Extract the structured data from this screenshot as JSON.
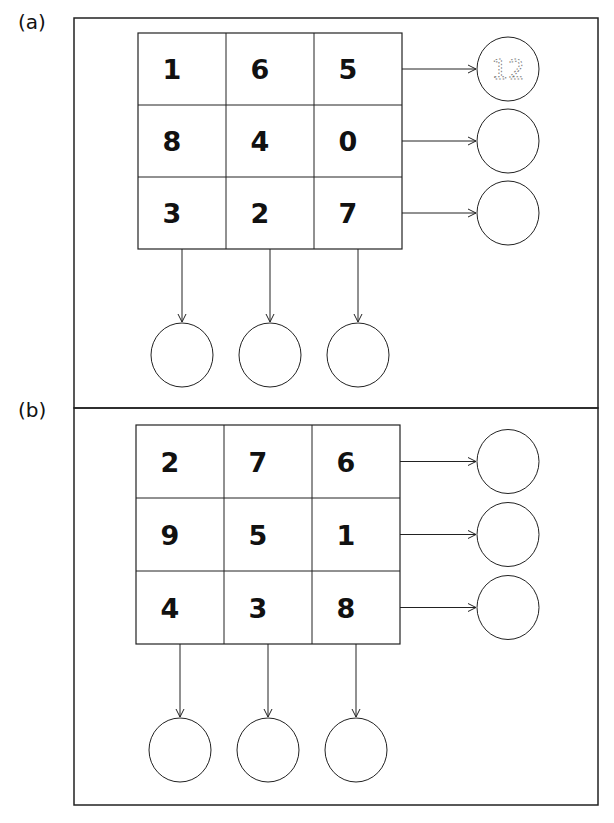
{
  "panels": [
    {
      "label": "(a)",
      "grid": [
        [
          1,
          6,
          5
        ],
        [
          8,
          4,
          0
        ],
        [
          3,
          2,
          7
        ]
      ],
      "row_sum_answers": [
        "12",
        "",
        ""
      ],
      "col_sum_answers": [
        "",
        "",
        ""
      ],
      "example_hint": "12"
    },
    {
      "label": "(b)",
      "grid": [
        [
          2,
          7,
          6
        ],
        [
          9,
          5,
          1
        ],
        [
          4,
          3,
          8
        ]
      ],
      "row_sum_answers": [
        "",
        "",
        ""
      ],
      "col_sum_answers": [
        "",
        "",
        ""
      ]
    }
  ],
  "colors": {
    "line": "#222222",
    "text": "#111111",
    "hint": "#777777"
  }
}
